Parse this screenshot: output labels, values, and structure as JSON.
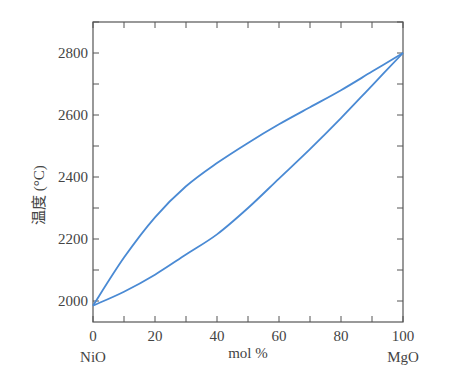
{
  "chart_data": {
    "type": "line",
    "title": "",
    "xlabel": "mol %",
    "ylabel": "温度 (°C)",
    "xlim": [
      0,
      100
    ],
    "ylim": [
      1950,
      2900
    ],
    "x_ticks": [
      "0",
      "20",
      "40",
      "60",
      "80",
      "100"
    ],
    "y_ticks": [
      "2000",
      "2200",
      "2400",
      "2600",
      "2800"
    ],
    "x_end_labels": {
      "left": "NiO",
      "right": "MgO"
    },
    "grid": false,
    "legend": null,
    "line_color": "#4a8ad4",
    "series": [
      {
        "name": "liquidus",
        "x": [
          0,
          10,
          20,
          30,
          40,
          50,
          60,
          70,
          80,
          90,
          100
        ],
        "y": [
          1985,
          2140,
          2270,
          2370,
          2445,
          2510,
          2570,
          2625,
          2680,
          2740,
          2800
        ]
      },
      {
        "name": "solidus",
        "x": [
          0,
          10,
          20,
          30,
          40,
          50,
          60,
          70,
          80,
          90,
          100
        ],
        "y": [
          1985,
          2030,
          2085,
          2150,
          2215,
          2300,
          2395,
          2490,
          2590,
          2695,
          2800
        ]
      }
    ]
  }
}
